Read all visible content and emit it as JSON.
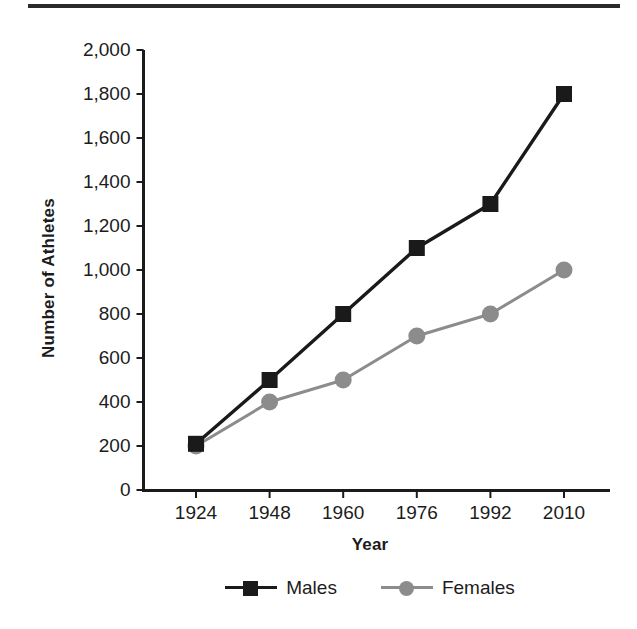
{
  "chart_data": {
    "type": "line",
    "title": "",
    "xlabel": "Year",
    "ylabel": "Number of Athletes",
    "categories": [
      "1924",
      "1948",
      "1960",
      "1976",
      "1992",
      "2010"
    ],
    "series": [
      {
        "name": "Males",
        "color": "#1a1a1a",
        "marker": "square",
        "values": [
          210,
          500,
          800,
          1100,
          1300,
          1800
        ]
      },
      {
        "name": "Females",
        "color": "#8c8c8c",
        "marker": "circle",
        "values": [
          200,
          400,
          500,
          700,
          800,
          1000
        ]
      }
    ],
    "ylim": [
      0,
      2000
    ],
    "ytick_step": 200,
    "ytick_labels": [
      "0",
      "200",
      "400",
      "600",
      "800",
      "1,000",
      "1,200",
      "1,400",
      "1,600",
      "1,800",
      "2,000"
    ],
    "grid": false,
    "legend_position": "bottom",
    "axis_color": "#1a1a1a"
  },
  "legend": {
    "entries": [
      {
        "label": "Males"
      },
      {
        "label": "Females"
      }
    ]
  },
  "decorations": {
    "top_rule_color": "#2b2b2b"
  }
}
